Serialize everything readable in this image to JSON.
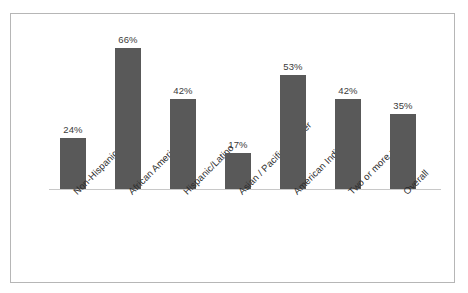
{
  "chart_data": {
    "type": "bar",
    "title": "",
    "subtitle": "",
    "xlabel": "",
    "ylabel": "",
    "ylim": [
      0,
      70
    ],
    "grid": false,
    "legend": "none",
    "axis": "category baseline only, no y-axis ticks or gridlines",
    "value_label_format": "{value}%",
    "bar_color": "#595959",
    "frame_color": "#b6b6b6",
    "axis_color": "#c8c8c8",
    "label_rotation_degrees": -45,
    "categories": [
      "Non-Hispanic white",
      "African American",
      "Hispanic/Latino",
      "Asian / Pacific Islander",
      "American Indian",
      "Two or more races",
      "Overall"
    ],
    "values": [
      24,
      66,
      42,
      17,
      53,
      42,
      35
    ],
    "value_labels": [
      "24%",
      "66%",
      "42%",
      "17%",
      "53%",
      "42%",
      "35%"
    ]
  }
}
